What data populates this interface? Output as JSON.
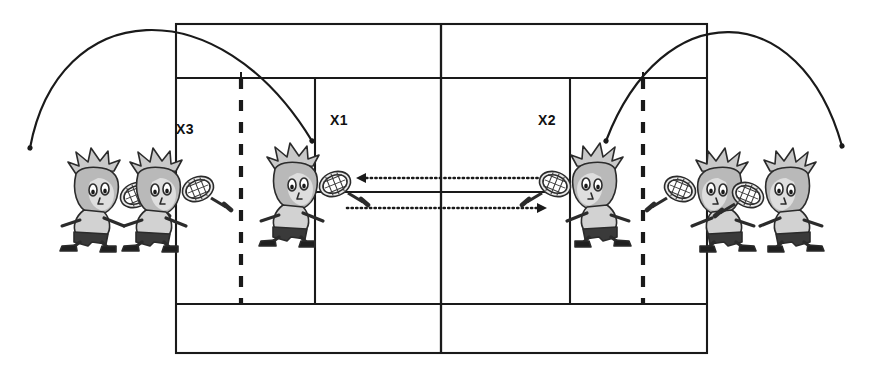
{
  "diagram": {
    "background_color": "#ffffff",
    "line_color": "#1a1a1a",
    "labels": [
      {
        "id": "x3",
        "text": "X3",
        "x": 176,
        "y": 134
      },
      {
        "id": "x1",
        "text": "X1",
        "x": 330,
        "y": 125
      },
      {
        "id": "x2",
        "text": "X2",
        "x": 538,
        "y": 125
      }
    ],
    "court": {
      "doubles": {
        "x": 176,
        "y": 24,
        "width": 531,
        "height": 329
      },
      "singles_top_y": 78,
      "singles_bottom_y": 304,
      "net_x": 441,
      "service_line_left_x": 315,
      "service_line_right_x": 570,
      "center_service_y": 192,
      "dashed_line_left_x": 241,
      "dashed_line_right_x": 643
    },
    "ball_paths": [
      {
        "id": "left-arc",
        "description": "ball arc descending from left toward receiving player",
        "start": {
          "x": 30,
          "y": 148
        },
        "peak": {
          "x": 148,
          "y": 41
        },
        "end": {
          "x": 312,
          "y": 141
        }
      },
      {
        "id": "right-arc",
        "description": "ball arc rising from right player over baseline",
        "start": {
          "x": 606,
          "y": 141
        },
        "peak": {
          "x": 722,
          "y": 55
        },
        "end": {
          "x": 842,
          "y": 146
        }
      }
    ],
    "rally_arrows": [
      {
        "id": "arrow-to-left",
        "direction": "left",
        "from": {
          "x": 555,
          "y": 178
        },
        "to": {
          "x": 358,
          "y": 178
        },
        "style": "dotted"
      },
      {
        "id": "arrow-to-right",
        "direction": "right",
        "from": {
          "x": 348,
          "y": 208
        },
        "to": {
          "x": 548,
          "y": 208
        },
        "style": "dotted"
      }
    ],
    "players": [
      {
        "id": "player-far-left-1",
        "x": 82,
        "y": 195,
        "facing": "right",
        "racket_side": "right"
      },
      {
        "id": "player-far-left-2",
        "x": 146,
        "y": 195,
        "facing": "right",
        "racket_side": "right"
      },
      {
        "id": "player-left-inside",
        "x": 285,
        "y": 190,
        "facing": "right",
        "racket_side": "right"
      },
      {
        "id": "player-right-inside",
        "x": 597,
        "y": 190,
        "facing": "right",
        "racket_side": "left"
      },
      {
        "id": "player-far-right-1",
        "x": 722,
        "y": 195,
        "facing": "right",
        "racket_side": "left"
      },
      {
        "id": "player-far-right-2",
        "x": 790,
        "y": 195,
        "facing": "right",
        "racket_side": "left"
      }
    ]
  }
}
